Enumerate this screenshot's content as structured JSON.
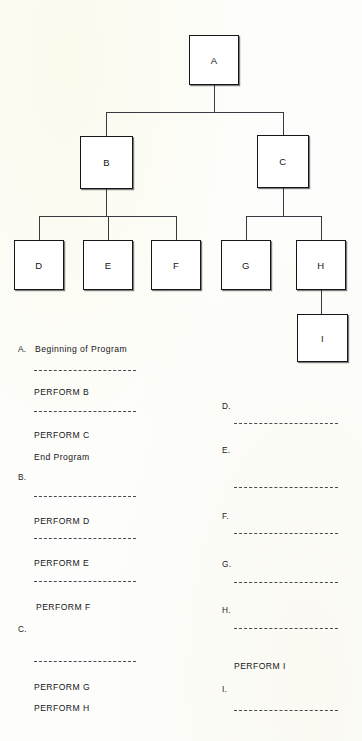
{
  "page": {
    "background_color": "#fdfdfb",
    "ink_color": "#15151a"
  },
  "chart": {
    "title": "",
    "type": "structure-chart",
    "nodes": [
      {
        "id": "A",
        "label": "A",
        "x": 189,
        "y": 35,
        "w": 50,
        "h": 50
      },
      {
        "id": "B",
        "label": "B",
        "x": 80,
        "y": 136,
        "w": 53,
        "h": 53
      },
      {
        "id": "C",
        "label": "C",
        "x": 257,
        "y": 135,
        "w": 52,
        "h": 53
      },
      {
        "id": "D",
        "label": "D",
        "x": 14,
        "y": 240,
        "w": 50,
        "h": 50
      },
      {
        "id": "E",
        "label": "E",
        "x": 83,
        "y": 240,
        "w": 50,
        "h": 50
      },
      {
        "id": "F",
        "label": "F",
        "x": 151,
        "y": 240,
        "w": 50,
        "h": 50
      },
      {
        "id": "G",
        "label": "G",
        "x": 221,
        "y": 240,
        "w": 50,
        "h": 50
      },
      {
        "id": "H",
        "label": "H",
        "x": 296,
        "y": 240,
        "w": 50,
        "h": 50
      },
      {
        "id": "I",
        "label": "I",
        "x": 297,
        "y": 314,
        "w": 51,
        "h": 48
      }
    ],
    "edges": [
      {
        "from": "A",
        "to": "B"
      },
      {
        "from": "A",
        "to": "C"
      },
      {
        "from": "B",
        "to": "D"
      },
      {
        "from": "B",
        "to": "E"
      },
      {
        "from": "B",
        "to": "F"
      },
      {
        "from": "C",
        "to": "G"
      },
      {
        "from": "C",
        "to": "H"
      },
      {
        "from": "H",
        "to": "I"
      }
    ]
  },
  "listing": {
    "left_column": [
      {
        "kind": "label",
        "text": "A.",
        "x": 18,
        "y": 344
      },
      {
        "kind": "statement",
        "text": "Beginning of Program",
        "x": 35,
        "y": 344
      },
      {
        "kind": "rule",
        "text": "",
        "x": 34,
        "y": 370,
        "w": 102
      },
      {
        "kind": "statement",
        "text": "PERFORM B",
        "x": 34,
        "y": 387
      },
      {
        "kind": "rule",
        "text": "",
        "x": 34,
        "y": 411,
        "w": 102
      },
      {
        "kind": "statement",
        "text": "PERFORM C",
        "x": 34,
        "y": 430
      },
      {
        "kind": "statement",
        "text": "End Program",
        "x": 34,
        "y": 452
      },
      {
        "kind": "label",
        "text": "B.",
        "x": 18,
        "y": 472
      },
      {
        "kind": "rule",
        "text": "",
        "x": 34,
        "y": 496,
        "w": 102
      },
      {
        "kind": "statement",
        "text": "PERFORM D",
        "x": 34,
        "y": 516
      },
      {
        "kind": "rule",
        "text": "",
        "x": 34,
        "y": 538,
        "w": 102
      },
      {
        "kind": "statement",
        "text": "PERFORM E",
        "x": 34,
        "y": 558
      },
      {
        "kind": "rule",
        "text": "",
        "x": 34,
        "y": 581,
        "w": 102
      },
      {
        "kind": "statement",
        "text": "PERFORM F",
        "x": 36,
        "y": 602
      },
      {
        "kind": "label",
        "text": "C.",
        "x": 18,
        "y": 624
      },
      {
        "kind": "rule",
        "text": "",
        "x": 34,
        "y": 661,
        "w": 102
      },
      {
        "kind": "statement",
        "text": "PERFORM G",
        "x": 34,
        "y": 682
      },
      {
        "kind": "statement",
        "text": "PERFORM H",
        "x": 34,
        "y": 703
      }
    ],
    "right_column": [
      {
        "kind": "label",
        "text": "D.",
        "x": 222,
        "y": 401
      },
      {
        "kind": "rule",
        "text": "",
        "x": 234,
        "y": 423,
        "w": 104
      },
      {
        "kind": "label",
        "text": "E.",
        "x": 222,
        "y": 445
      },
      {
        "kind": "rule",
        "text": "",
        "x": 234,
        "y": 487,
        "w": 104
      },
      {
        "kind": "label",
        "text": "F.",
        "x": 222,
        "y": 511
      },
      {
        "kind": "rule",
        "text": "",
        "x": 234,
        "y": 533,
        "w": 104
      },
      {
        "kind": "label",
        "text": "G.",
        "x": 222,
        "y": 559
      },
      {
        "kind": "rule",
        "text": "",
        "x": 234,
        "y": 582,
        "w": 104
      },
      {
        "kind": "label",
        "text": "H.",
        "x": 222,
        "y": 605
      },
      {
        "kind": "rule",
        "text": "",
        "x": 234,
        "y": 628,
        "w": 104
      },
      {
        "kind": "statement",
        "text": "PERFORM I",
        "x": 234,
        "y": 661
      },
      {
        "kind": "label",
        "text": "I.",
        "x": 222,
        "y": 684
      },
      {
        "kind": "rule",
        "text": "",
        "x": 234,
        "y": 710,
        "w": 104
      }
    ]
  }
}
